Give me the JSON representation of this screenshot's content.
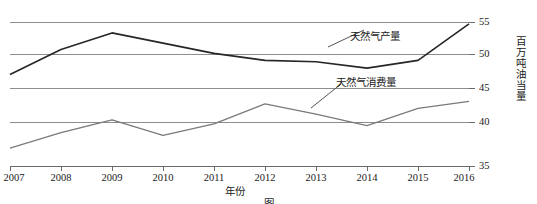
{
  "chart_data": {
    "type": "line",
    "title": "",
    "xlabel": "年份",
    "ylabel": "百万吨油当量",
    "x": [
      2007,
      2008,
      2009,
      2010,
      2011,
      2012,
      2013,
      2014,
      2015,
      2016
    ],
    "xtick_labels": [
      "2007",
      "2008",
      "2009",
      "2010",
      "2011",
      "2012",
      "2013",
      "2014",
      "2015",
      "2016"
    ],
    "ytick_labels": [
      "35",
      "40",
      "45",
      "50",
      "55"
    ],
    "yticks": [
      35,
      40,
      45,
      50,
      55
    ],
    "ylim": [
      35,
      57.5
    ],
    "xlim": [
      2007,
      2016
    ],
    "grid": "horizontal",
    "legend_position": "inline-annotation",
    "series": [
      {
        "name": "天然气产量",
        "color": "#262626",
        "values": [
          49.3,
          53.2,
          55.8,
          54.2,
          52.6,
          51.5,
          51.3,
          50.3,
          51.5,
          57.2
        ]
      },
      {
        "name": "天然气消费量",
        "color": "#7a7a7a",
        "values": [
          37.8,
          40.2,
          42.2,
          39.8,
          41.6,
          44.7,
          43.1,
          41.3,
          44.0,
          45.1
        ]
      }
    ],
    "annotations": [
      {
        "text": "天然气产量",
        "target_year": 2012
      },
      {
        "text": "天然气消费量",
        "target_year": 2013
      }
    ]
  },
  "caption": "图",
  "colors": {
    "production_line": "#262626",
    "consumption_line": "#7a7a7a",
    "gridline": "#8e8e8e",
    "axis": "#6b6b6b",
    "text": "#1a1a1a"
  }
}
